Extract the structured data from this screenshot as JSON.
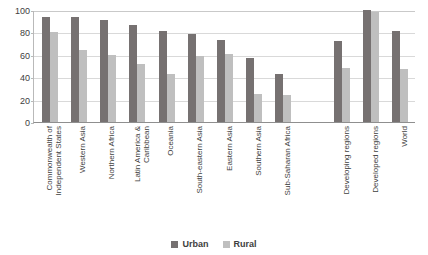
{
  "chart_data": {
    "type": "bar",
    "title": "",
    "xlabel": "",
    "ylabel": "",
    "ylim": [
      0,
      100
    ],
    "yticks": [
      0,
      20,
      40,
      60,
      80,
      100
    ],
    "grid": true,
    "legend_position": "bottom",
    "categories": [
      "Commonwealth of Independent States",
      "Western Asia",
      "Northern Africa",
      "Latin America & Caribbean",
      "Oceania",
      "South-eastern Asia",
      "Eastern Asia",
      "Southern Asia",
      "Sub-Saharan Africa",
      "",
      "Developing regions",
      "Developed regions",
      "World"
    ],
    "category_lines": [
      [
        "Commonwealth of",
        "Independent States"
      ],
      [
        "Western Asia"
      ],
      [
        "Northern Africa"
      ],
      [
        "Latin America &",
        "Caribbean"
      ],
      [
        "Oceania"
      ],
      [
        "South-eastern Asia"
      ],
      [
        "Eastern Asia"
      ],
      [
        "Southern Asia"
      ],
      [
        "Sub-Saharan Africa"
      ],
      [
        ""
      ],
      [
        "Developing regions"
      ],
      [
        "Developed regions"
      ],
      [
        "World"
      ]
    ],
    "series": [
      {
        "name": "Urban",
        "color": "#767171",
        "values": [
          94,
          94,
          91,
          87,
          81,
          79,
          73,
          57,
          43,
          null,
          72,
          100,
          81
        ]
      },
      {
        "name": "Rural",
        "color": "#bfbfbf",
        "values": [
          80,
          64,
          60,
          52,
          43,
          59,
          61,
          25,
          24,
          null,
          48,
          98,
          47
        ]
      }
    ]
  },
  "legend": {
    "items": [
      {
        "label": "Urban",
        "color": "#767171"
      },
      {
        "label": "Rural",
        "color": "#bfbfbf"
      }
    ]
  },
  "axis": {
    "y_tick_labels": [
      "100",
      "80",
      "60",
      "40",
      "20",
      "0"
    ]
  }
}
